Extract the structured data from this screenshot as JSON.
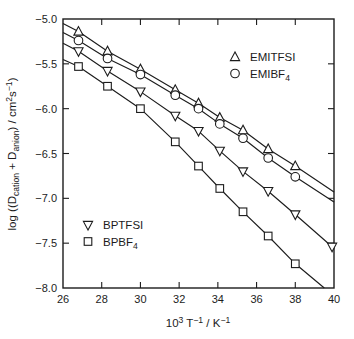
{
  "figure": {
    "background": "#ffffff",
    "ink_color": "#1c1c1c",
    "width": 354,
    "height": 339
  },
  "chart_data": {
    "type": "line",
    "title": "",
    "grid": false,
    "xlim": [
      26,
      40
    ],
    "ylim": [
      -8.0,
      -5.0
    ],
    "x_ticks": [
      26,
      28,
      30,
      32,
      34,
      36,
      38,
      40
    ],
    "y_ticks": [
      -5.0,
      -5.5,
      -6.0,
      -6.5,
      -7.0,
      -7.5,
      -8.0
    ],
    "xlabel_parts": [
      {
        "text": "10"
      },
      {
        "text": "3",
        "style": "sup"
      },
      {
        "text": " T"
      },
      {
        "text": "−1",
        "style": "sup"
      },
      {
        "text": " / K"
      },
      {
        "text": "−1",
        "style": "sup"
      }
    ],
    "ylabel_parts": [
      {
        "text": "log ((D"
      },
      {
        "text": "cation",
        "style": "sub"
      },
      {
        "text": " + D"
      },
      {
        "text": "anion",
        "style": "sub"
      },
      {
        "text": ") / cm"
      },
      {
        "text": "2",
        "style": "sup"
      },
      {
        "text": "s"
      },
      {
        "text": "−1",
        "style": "sup"
      },
      {
        "text": ")"
      }
    ],
    "series": [
      {
        "name": "EMITFSI",
        "marker": "triangle-up",
        "label_parts": [
          {
            "text": "EMITFSI"
          }
        ],
        "x": [
          26.8,
          28.3,
          30.0,
          31.8,
          33.0,
          34.1,
          35.3,
          36.6,
          38.0
        ],
        "y": [
          -5.14,
          -5.36,
          -5.56,
          -5.79,
          -5.94,
          -6.1,
          -6.24,
          -6.45,
          -6.64
        ],
        "line_start": [
          26.0,
          -5.05
        ],
        "line_end": [
          40.0,
          -6.93
        ]
      },
      {
        "name": "EMIBF4",
        "marker": "circle",
        "label_parts": [
          {
            "text": "EMIBF"
          },
          {
            "text": "4",
            "style": "sub"
          }
        ],
        "x": [
          26.8,
          28.3,
          30.0,
          31.8,
          33.0,
          34.1,
          35.3,
          36.6,
          38.0
        ],
        "y": [
          -5.24,
          -5.44,
          -5.62,
          -5.85,
          -6.0,
          -6.17,
          -6.33,
          -6.55,
          -6.76
        ],
        "line_start": [
          26.0,
          -5.15
        ],
        "line_end": [
          40.0,
          -7.04
        ]
      },
      {
        "name": "BPTFSI",
        "marker": "triangle-down",
        "label_parts": [
          {
            "text": "BPTFSI"
          }
        ],
        "x": [
          26.8,
          28.3,
          30.0,
          31.8,
          33.0,
          34.1,
          35.3,
          36.6,
          38.0,
          39.9
        ],
        "y": [
          -5.36,
          -5.58,
          -5.81,
          -6.08,
          -6.25,
          -6.47,
          -6.7,
          -6.92,
          -7.18,
          -7.54
        ],
        "line_start": [
          26.0,
          -5.27
        ],
        "line_end": [
          40.0,
          -7.56
        ]
      },
      {
        "name": "BPBF4",
        "marker": "square",
        "label_parts": [
          {
            "text": "BPBF"
          },
          {
            "text": "4",
            "style": "sub"
          }
        ],
        "x": [
          26.8,
          28.3,
          30.0,
          31.8,
          33.0,
          34.1,
          35.3,
          36.6,
          38.0
        ],
        "y": [
          -5.53,
          -5.75,
          -6.0,
          -6.37,
          -6.64,
          -6.89,
          -7.15,
          -7.42,
          -7.73
        ],
        "line_start": [
          26.0,
          -5.45
        ],
        "line_end": [
          39.5,
          -8.0
        ]
      }
    ],
    "legends": [
      {
        "position": "top-right",
        "anchor_px": [
          235,
          57
        ],
        "row_gap": 16.5,
        "items": [
          "EMITFSI",
          "EMIBF4"
        ]
      },
      {
        "position": "bottom-left",
        "anchor_px": [
          88,
          225
        ],
        "row_gap": 16.5,
        "items": [
          "BPTFSI",
          "BPBF4"
        ]
      }
    ],
    "plot_area_px": {
      "left": 63,
      "right": 334,
      "top": 19,
      "bottom": 288
    }
  }
}
